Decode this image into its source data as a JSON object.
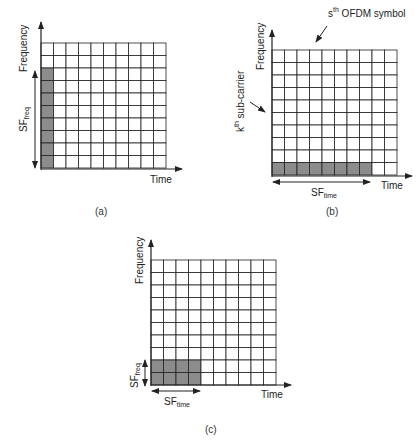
{
  "panels": [
    {
      "id": "a",
      "caption": "(a)",
      "x_axis_label": "Time",
      "y_axis_label": "Frequency",
      "spreading_label": {
        "main": "SF",
        "sub": "freq"
      },
      "grid": {
        "cols": 10,
        "rows": 10,
        "x": 41,
        "y": 43,
        "cell": 12.5
      },
      "shaded": {
        "col_start": 0,
        "col_end": 0,
        "row_start": 2,
        "row_end": 9
      }
    },
    {
      "id": "b",
      "caption": "(b)",
      "x_axis_label": "Time",
      "y_axis_label": "Frequency",
      "spreading_label": {
        "main": "SF",
        "sub": "time"
      },
      "symbol_annotation": {
        "pre": "s",
        "sup": "th",
        "post": " OFDM symbol"
      },
      "subcarrier_annotation": {
        "pre": "k",
        "sup": "th",
        "post": " sub-carrier"
      },
      "grid": {
        "cols": 10,
        "rows": 10,
        "x": 272,
        "y": 50,
        "cell": 12.5
      },
      "shaded": {
        "col_start": 0,
        "col_end": 7,
        "row_start": 9,
        "row_end": 9
      }
    },
    {
      "id": "c",
      "caption": "(c)",
      "x_axis_label": "Time",
      "y_axis_label": "Frequency",
      "spreading_label_freq": {
        "main": "SF",
        "sub": "freq"
      },
      "spreading_label_time": {
        "main": "SF",
        "sub": "time"
      },
      "grid": {
        "cols": 10,
        "rows": 10,
        "x": 151,
        "y": 260,
        "cell": 12.5
      },
      "shaded": {
        "col_start": 0,
        "col_end": 3,
        "row_start": 8,
        "row_end": 9
      }
    }
  ],
  "colors": {
    "grid_line": "#222222",
    "shade": "#8c8c8c",
    "cell": "#ffffff"
  }
}
